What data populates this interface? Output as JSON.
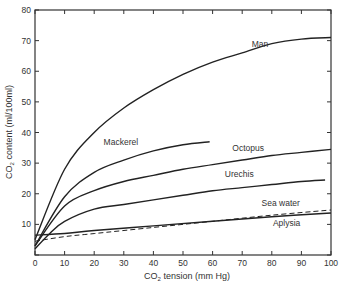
{
  "chart_data": {
    "type": "line",
    "title": "",
    "xlabel": "CO2 tension (mm Hg)",
    "ylabel": "CO2 content (ml/100ml)",
    "xlim": [
      0,
      100
    ],
    "ylim": [
      0,
      80
    ],
    "xticks": [
      0,
      10,
      20,
      30,
      40,
      50,
      60,
      70,
      80,
      90,
      100
    ],
    "yticks": [
      10,
      20,
      30,
      40,
      50,
      60,
      70,
      80
    ],
    "grid": false,
    "legend": "inline labels",
    "series": [
      {
        "name": "Man",
        "style": "solid",
        "x": [
          0,
          10,
          20,
          30,
          40,
          50,
          60,
          70,
          80,
          90,
          100
        ],
        "values": [
          5,
          28,
          40,
          48,
          54,
          59,
          63,
          66,
          69,
          70.5,
          71
        ],
        "label_pos": [
          76,
          68
        ]
      },
      {
        "name": "Mackerel",
        "style": "solid",
        "x": [
          0,
          10,
          20,
          30,
          40,
          50,
          59
        ],
        "values": [
          3,
          19,
          27,
          31,
          34,
          36,
          37
        ],
        "label_pos": [
          29,
          36
        ]
      },
      {
        "name": "Octopus",
        "style": "solid",
        "x": [
          0,
          10,
          20,
          30,
          40,
          50,
          60,
          70,
          80,
          90,
          100
        ],
        "values": [
          3,
          16,
          21,
          24,
          26,
          28,
          29.5,
          31,
          32.5,
          33.5,
          34.5
        ],
        "label_pos": [
          72,
          34
        ]
      },
      {
        "name": "Urechis",
        "style": "solid",
        "x": [
          0,
          5,
          10,
          20,
          30,
          40,
          50,
          60,
          70,
          80,
          90,
          98
        ],
        "values": [
          2,
          7,
          11,
          15,
          16.5,
          18,
          19.5,
          21,
          22,
          23,
          24,
          24.5
        ],
        "label_pos": [
          69,
          25.5
        ]
      },
      {
        "name": "Sea water",
        "style": "dashed",
        "x": [
          0,
          10,
          20,
          40,
          60,
          80,
          100
        ],
        "values": [
          4.5,
          6,
          7,
          9,
          11,
          13,
          14.7
        ],
        "label_pos": [
          83,
          16
        ]
      },
      {
        "name": "Aplysia",
        "style": "solid",
        "x": [
          0,
          10,
          20,
          40,
          60,
          80,
          100
        ],
        "values": [
          6.5,
          7,
          8,
          9.5,
          11,
          12.5,
          13.7
        ],
        "label_pos": [
          85,
          9.5
        ]
      }
    ]
  },
  "labels": {
    "ylabel_prefix": "CO",
    "ylabel_sub": "2",
    "ylabel_suffix": " content (ml/100ml)",
    "xlabel_prefix": "CO",
    "xlabel_sub": "2",
    "xlabel_suffix": " tension (mm Hg)"
  }
}
